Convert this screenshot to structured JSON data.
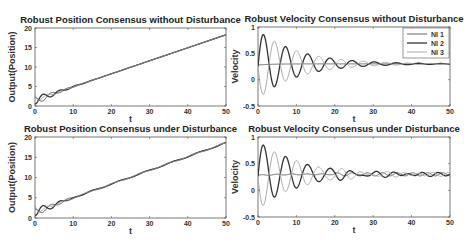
{
  "figure": {
    "width": 466,
    "height": 245
  },
  "chart_data": [
    {
      "id": "pos_no_dist",
      "type": "line",
      "title": "Robust Position Consensus without Disturbance",
      "xlabel": "t",
      "ylabel": "Output(Position)",
      "xlim": [
        0,
        50
      ],
      "ylim": [
        0,
        20
      ],
      "xticks": [
        0,
        10,
        20,
        30,
        40,
        50
      ],
      "yticks": [
        0,
        5,
        10,
        15,
        20
      ],
      "grid": false,
      "legend": null,
      "box": {
        "x": 35,
        "y": 28,
        "w": 191,
        "h": 78
      },
      "model": "position",
      "disturbance": false,
      "series": [
        {
          "name": "NI 1",
          "color": "#555555",
          "start": 1.0,
          "slope": 0.33,
          "amp": 1.2,
          "phase": 0.0
        },
        {
          "name": "NI 2",
          "color": "#333333",
          "start": 2.0,
          "slope": 0.33,
          "amp": 1.4,
          "phase": 3.14
        },
        {
          "name": "NI 3",
          "color": "#999999",
          "start": 3.0,
          "slope": 0.33,
          "amp": 0.8,
          "phase": 1.6
        }
      ],
      "final_value": 17
    },
    {
      "id": "vel_no_dist",
      "type": "line",
      "title": "Robust Velocity Consensus without Disturbance",
      "xlabel": "t",
      "ylabel": "Velocity",
      "xlim": [
        0,
        50
      ],
      "ylim": [
        -0.5,
        1
      ],
      "xticks": [
        0,
        10,
        20,
        30,
        40,
        50
      ],
      "yticks": [
        -0.5,
        0,
        0.5,
        1
      ],
      "grid": false,
      "legend": {
        "position": "upper right",
        "entries": [
          "NI 1",
          "NI 2",
          "NI 3"
        ]
      },
      "box": {
        "x": 258,
        "y": 27,
        "w": 192,
        "h": 79
      },
      "model": "velocity",
      "disturbance": false,
      "consensus_value": 0.3,
      "series": [
        {
          "name": "NI 1",
          "color": "#666666",
          "amp": 0.02,
          "phase": 0.0,
          "peak": 0.28
        },
        {
          "name": "NI 2",
          "color": "#333333",
          "amp": 0.65,
          "phase": 0.0,
          "peak": 0.95
        },
        {
          "name": "NI 3",
          "color": "#aaaaaa",
          "amp": 0.65,
          "phase": 3.14159,
          "peak": -0.35
        }
      ],
      "omega": 1.45,
      "decay": 0.095
    },
    {
      "id": "pos_dist",
      "type": "line",
      "title": "Robust Position Consensus under Disturbance",
      "xlabel": "t",
      "ylabel": "Output(Position)",
      "xlim": [
        0,
        50
      ],
      "ylim": [
        0,
        20
      ],
      "xticks": [
        0,
        10,
        20,
        30,
        40,
        50
      ],
      "yticks": [
        0,
        5,
        10,
        15,
        20
      ],
      "grid": false,
      "legend": null,
      "box": {
        "x": 35,
        "y": 137,
        "w": 191,
        "h": 81
      },
      "model": "position",
      "disturbance": true,
      "series": [
        {
          "name": "NI 1",
          "color": "#555555",
          "start": 1.0,
          "slope": 0.33,
          "amp": 1.2,
          "phase": 0.0
        },
        {
          "name": "NI 2",
          "color": "#333333",
          "start": 2.0,
          "slope": 0.33,
          "amp": 1.4,
          "phase": 3.14
        },
        {
          "name": "NI 3",
          "color": "#999999",
          "start": 3.0,
          "slope": 0.33,
          "amp": 0.8,
          "phase": 1.6
        }
      ],
      "final_value": 17.3
    },
    {
      "id": "vel_dist",
      "type": "line",
      "title": "Robust Velocity Consensus under Disturbance",
      "xlabel": "t",
      "ylabel": "Velocity",
      "xlim": [
        0,
        50
      ],
      "ylim": [
        -0.5,
        1
      ],
      "xticks": [
        0,
        10,
        20,
        30,
        40,
        50
      ],
      "yticks": [
        -0.5,
        0,
        0.5,
        1
      ],
      "grid": false,
      "legend": null,
      "box": {
        "x": 258,
        "y": 137,
        "w": 192,
        "h": 80
      },
      "model": "velocity",
      "disturbance": true,
      "consensus_value": 0.3,
      "series": [
        {
          "name": "NI 1",
          "color": "#666666",
          "amp": 0.02,
          "phase": 0.0,
          "peak": 0.28
        },
        {
          "name": "NI 2",
          "color": "#333333",
          "amp": 0.65,
          "phase": 0.0,
          "peak": 0.97
        },
        {
          "name": "NI 3",
          "color": "#aaaaaa",
          "amp": 0.65,
          "phase": 3.14159,
          "peak": -0.35
        }
      ],
      "omega": 1.45,
      "decay": 0.095,
      "residual_amp": 0.03
    }
  ]
}
